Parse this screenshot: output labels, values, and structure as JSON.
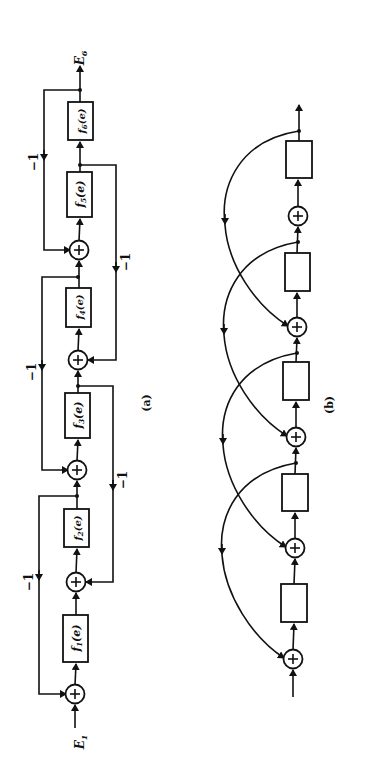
{
  "figure": {
    "orientation": "rotated-90-ccw",
    "panel_a": {
      "caption": "(a)",
      "input_label": "E",
      "input_sub": "1",
      "output_label": "E",
      "output_sub": "6",
      "blocks": [
        {
          "label": "f",
          "sub": "1",
          "arg": "(e)"
        },
        {
          "label": "f",
          "sub": "2",
          "arg": "(e)"
        },
        {
          "label": "f",
          "sub": "3",
          "arg": "(e)"
        },
        {
          "label": "f",
          "sub": "4",
          "arg": "(e)"
        },
        {
          "label": "f",
          "sub": "5",
          "arg": "(e)"
        },
        {
          "label": "f",
          "sub": "6",
          "arg": "(e)"
        }
      ],
      "gains": [
        "−1",
        "−1",
        "−1",
        "−1",
        "−1",
        "−1"
      ],
      "summing_symbol": "+"
    },
    "panel_b": {
      "caption": "(b)",
      "block_count": 5,
      "summing_junction_count": 5,
      "summing_symbol": "+"
    }
  }
}
